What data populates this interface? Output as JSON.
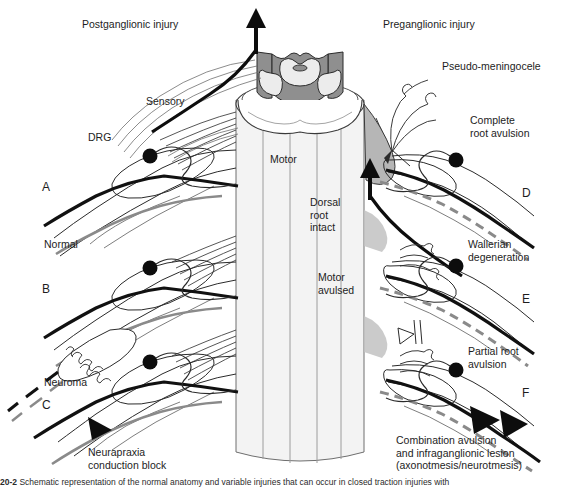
{
  "figure": {
    "title_left": "Postganglionic injury",
    "title_right": "Preganglionic injury",
    "caption_number": "20-2",
    "caption_text": "Schematic representation of the normal anatomy and variable injuries that can occur in closed traction injuries with"
  },
  "labels": {
    "sensory": "Sensory",
    "drg": "DRG",
    "motor": "Motor",
    "pseudo_meningocele": "Pseudo-meningocele",
    "complete_root_avulsion": "Complete\nroot avulsion",
    "dorsal_root_intact": "Dorsal\nroot\nintact",
    "wallerian_degeneration": "Wallerian\ndegeneration",
    "motor_avulsed": "Motor\navulsed",
    "partial_root_avulsion": "Partial root\navulsion",
    "normal": "Normal",
    "neuroma": "Neuroma",
    "neurapraxia": "Neurapraxia\nconduction block",
    "combination": "Combination avulsion\nand infraganglionic lesion\n(axonotmesis/neurotmesis)"
  },
  "panels": {
    "a": "A",
    "b": "B",
    "c": "C",
    "d": "D",
    "e": "E",
    "f": "F"
  },
  "colors": {
    "background": "#ffffff",
    "ink": "#1a1a1a",
    "gray_matter": "#9a9a9a",
    "white_matter": "#efefef",
    "cord_body": "#f2f2f2",
    "dura_gray": "#b4b4b4",
    "degeneration_dash": "#8c8c8c",
    "outline": "#2b2b2b"
  }
}
